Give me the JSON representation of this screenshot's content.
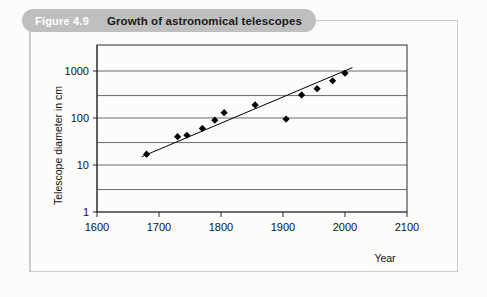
{
  "figure": {
    "number_label": "Figure 4.9",
    "title": "Growth of astronomical telescopes"
  },
  "chart_data": {
    "type": "scatter",
    "title": "Growth of astronomical telescopes",
    "xlabel": "Year",
    "ylabel": "Telescope diameter in cm",
    "xlim": [
      1600,
      2100
    ],
    "ylim": [
      1,
      1000
    ],
    "yscale": "log",
    "grid": true,
    "legend": false,
    "xticks": [
      "1600",
      "1700",
      "1800",
      "1900",
      "2000",
      "2100"
    ],
    "xtick_values": [
      1600,
      1700,
      1800,
      1900,
      2000,
      2100
    ],
    "yticks": [
      "1",
      "10",
      "100",
      "1000"
    ],
    "ytick_values": [
      1,
      10,
      100,
      1000
    ],
    "minor_gridlines": [
      3,
      30,
      300
    ],
    "series": [
      {
        "name": "Telescope diameter",
        "marker": "diamond",
        "color": "#000000",
        "points": [
          {
            "x": 1680,
            "y": 17
          },
          {
            "x": 1730,
            "y": 40
          },
          {
            "x": 1745,
            "y": 43
          },
          {
            "x": 1770,
            "y": 60
          },
          {
            "x": 1790,
            "y": 90
          },
          {
            "x": 1805,
            "y": 130
          },
          {
            "x": 1855,
            "y": 190
          },
          {
            "x": 1905,
            "y": 95
          },
          {
            "x": 1930,
            "y": 310
          },
          {
            "x": 1955,
            "y": 420
          },
          {
            "x": 1980,
            "y": 620
          },
          {
            "x": 2000,
            "y": 900
          }
        ]
      }
    ],
    "trendline": {
      "name": "trend",
      "color": "#000000",
      "x_start": 1672,
      "y_start": 15,
      "x_end": 2012,
      "y_end": 1180
    }
  }
}
